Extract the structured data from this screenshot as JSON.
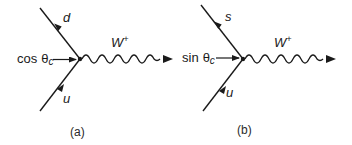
{
  "diagrams": [
    {
      "id": "a",
      "caption": "(a)",
      "outgoing_quark": "d",
      "incoming_quark": "u",
      "boson": "W",
      "boson_charge": "+",
      "coupling_func": "cos",
      "coupling_angle": "θ",
      "coupling_sub": "c"
    },
    {
      "id": "b",
      "caption": "(b)",
      "outgoing_quark": "s",
      "incoming_quark": "u",
      "boson": "W",
      "boson_charge": "+",
      "coupling_func": "sin",
      "coupling_angle": "θ",
      "coupling_sub": "c"
    }
  ],
  "colors": {
    "ink": "#1a1a1a",
    "background": "#ffffff"
  }
}
